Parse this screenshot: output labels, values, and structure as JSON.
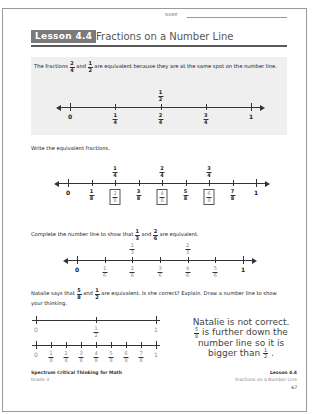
{
  "header": {
    "name_label": "NAME",
    "lesson_badge": "Lesson 4.4",
    "lesson_title": "Fractions on a Number Line"
  },
  "intro": {
    "text_part1": "The fractions",
    "frac_a": {
      "num": "2",
      "den": "4"
    },
    "text_and": "and",
    "frac_b": {
      "num": "1",
      "den": "2"
    },
    "text_part2": "are equivalent because they are at the same spot on the number line.",
    "number_line": {
      "top_labels": [
        {
          "pos": 0.5,
          "num": "1",
          "den": "2"
        }
      ],
      "bottom_labels": [
        {
          "pos": 0,
          "text": "0"
        },
        {
          "pos": 0.25,
          "num": "1",
          "den": "4"
        },
        {
          "pos": 0.5,
          "num": "2",
          "den": "4"
        },
        {
          "pos": 0.75,
          "num": "3",
          "den": "4"
        },
        {
          "pos": 1,
          "text": "1"
        }
      ]
    }
  },
  "section2": {
    "instruction": "Write the equivalent fractions.",
    "top_labels": [
      {
        "pos": 0.25,
        "num": "1",
        "den": "4"
      },
      {
        "pos": 0.5,
        "num": "2",
        "den": "4"
      },
      {
        "pos": 0.75,
        "num": "3",
        "den": "4"
      }
    ],
    "bottom_labels": [
      {
        "pos": 0,
        "text": "0"
      },
      {
        "pos": 0.125,
        "num": "1",
        "den": "8"
      },
      {
        "pos": 0.25,
        "num": "2",
        "den": "8",
        "answer": true
      },
      {
        "pos": 0.375,
        "num": "3",
        "den": "8"
      },
      {
        "pos": 0.5,
        "num": "4",
        "den": "8",
        "answer": true
      },
      {
        "pos": 0.625,
        "num": "5",
        "den": "8"
      },
      {
        "pos": 0.75,
        "num": "6",
        "den": "8",
        "answer": true
      },
      {
        "pos": 0.875,
        "num": "7",
        "den": "8"
      },
      {
        "pos": 1,
        "text": "1"
      }
    ]
  },
  "section3": {
    "instruction_part1": "Complete the number line to show that",
    "frac_a": {
      "num": "1",
      "den": "3"
    },
    "text_and": "and",
    "frac_b": {
      "num": "2",
      "den": "6"
    },
    "instruction_part2": "are equivalent.",
    "top_labels": [
      {
        "pos": 0.3333,
        "num": "1",
        "den": "3",
        "answer": true
      },
      {
        "pos": 0.6667,
        "num": "2",
        "den": "3",
        "answer": true
      }
    ],
    "bottom_labels": [
      {
        "pos": 0,
        "text": "0"
      },
      {
        "pos": 0.1667,
        "num": "1",
        "den": "6",
        "answer": true
      },
      {
        "pos": 0.3333,
        "num": "2",
        "den": "6",
        "answer": true
      },
      {
        "pos": 0.5,
        "num": "3",
        "den": "6",
        "answer": true
      },
      {
        "pos": 0.6667,
        "num": "4",
        "den": "6",
        "answer": true
      },
      {
        "pos": 0.8333,
        "num": "5",
        "den": "6",
        "answer": true
      },
      {
        "pos": 1,
        "text": "1"
      }
    ]
  },
  "section4": {
    "question_part1": "Natalie says that",
    "frac_a": {
      "num": "5",
      "den": "8"
    },
    "text_and": "and",
    "frac_b": {
      "num": "1",
      "den": "2"
    },
    "question_part2": "are equivalent. Is she correct? Explain. Draw a number line to show your thinking.",
    "line1_labels": [
      {
        "pos": 0,
        "text": "0"
      },
      {
        "pos": 0.5,
        "num": "1",
        "den": "2"
      },
      {
        "pos": 1,
        "text": "1"
      }
    ],
    "line2_labels": [
      {
        "pos": 0,
        "text": "0"
      },
      {
        "pos": 0.125,
        "num": "1",
        "den": "8"
      },
      {
        "pos": 0.25,
        "num": "2",
        "den": "8"
      },
      {
        "pos": 0.375,
        "num": "3",
        "den": "8"
      },
      {
        "pos": 0.5,
        "num": "4",
        "den": "8"
      },
      {
        "pos": 0.625,
        "num": "5",
        "den": "8"
      },
      {
        "pos": 0.75,
        "num": "6",
        "den": "8"
      },
      {
        "pos": 0.875,
        "num": "7",
        "den": "8"
      },
      {
        "pos": 1,
        "text": "1"
      }
    ],
    "answer_line1": "Natalie is not correct.",
    "answer_frac": {
      "num": "5",
      "den": "8"
    },
    "answer_line2": "is further down the",
    "answer_line3": "number line so it is",
    "answer_line4": "bigger than",
    "answer_frac2": {
      "num": "1",
      "den": "2"
    }
  },
  "footer": {
    "book_title": "Spectrum Critical Thinking for Math",
    "grade": "Grade 3",
    "lesson": "Lesson 4.4",
    "lesson_title": "Fractions on a Number Line",
    "page_number": "67"
  }
}
